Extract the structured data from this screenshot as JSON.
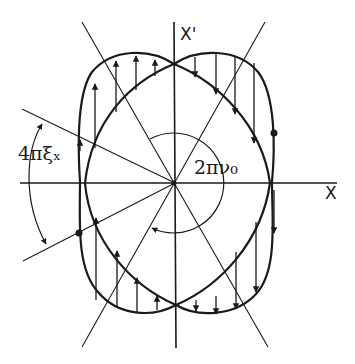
{
  "figure": {
    "width": 355,
    "height": 364,
    "ink_color": "#1a1a1a",
    "background": "#ffffff",
    "center": [
      175,
      183
    ]
  },
  "labels": {
    "x_axis": "X",
    "x_prime_axis": "X'",
    "tune_angle": "2πν₀",
    "chromatic_angle": "4πξₓ"
  },
  "axes": {
    "horizontal": {
      "x1": 20,
      "y1": 183,
      "x2": 337,
      "y2": 183
    },
    "vertical": {
      "x1": 174,
      "y1": 22,
      "x2": 176,
      "y2": 348
    }
  },
  "radial_lines": [
    {
      "name": "radial-line-upper-left",
      "x1": 82,
      "y1": 22,
      "x2": 268,
      "y2": 347
    },
    {
      "name": "radial-line-upper-right",
      "x1": 265,
      "y1": 22,
      "x2": 82,
      "y2": 347
    },
    {
      "name": "radial-line-shallow-left",
      "x1": 22,
      "y1": 109,
      "x2": 175,
      "y2": 183
    },
    {
      "name": "radial-line-shallow-lower",
      "x1": 175,
      "y1": 183,
      "x2": 23,
      "y2": 261
    }
  ],
  "curves": {
    "outer_left": "M 174 64 C 150 48, 112 48, 92 72 C 76 95, 78 150, 80 182 C 80 220, 76 268, 98 292 C 118 316, 152 318, 176 305",
    "outer_right": "M 174 64 C 198 48, 238 48, 258 72 C 276 95, 275 150, 272 182 C 272 220, 278 270, 256 294 C 236 316, 198 318, 176 305",
    "inner_left": "M 174 64 C 130 82, 92 120, 85 183 C 90 240, 130 285, 176 305",
    "inner_right": "M 174 64 C 218 82, 262 125, 270 183 C 262 240, 222 285, 176 305"
  },
  "arrows_up": [
    {
      "x": 80,
      "y1": 151,
      "y2": 140
    },
    {
      "x": 95,
      "y1": 148,
      "y2": 84
    },
    {
      "x": 116,
      "y1": 112,
      "y2": 61
    },
    {
      "x": 136,
      "y1": 90,
      "y2": 56
    },
    {
      "x": 155,
      "y1": 76,
      "y2": 60
    },
    {
      "x": 96,
      "y1": 300,
      "y2": 218
    },
    {
      "x": 117,
      "y1": 306,
      "y2": 251
    },
    {
      "x": 137,
      "y1": 313,
      "y2": 278
    },
    {
      "x": 157,
      "y1": 310,
      "y2": 296
    }
  ],
  "arrows_down": [
    {
      "x": 195,
      "y1": 57,
      "y2": 77
    },
    {
      "x": 216,
      "y1": 54,
      "y2": 94
    },
    {
      "x": 235,
      "y1": 57,
      "y2": 114
    },
    {
      "x": 254,
      "y1": 63,
      "y2": 143
    },
    {
      "x": 196,
      "y1": 300,
      "y2": 311
    },
    {
      "x": 216,
      "y1": 296,
      "y2": 314
    },
    {
      "x": 236,
      "y1": 252,
      "y2": 309
    },
    {
      "x": 256,
      "y1": 222,
      "y2": 292
    },
    {
      "x": 274,
      "y1": 190,
      "y2": 233
    }
  ],
  "dots": [
    {
      "x": 274,
      "y": 133
    },
    {
      "x": 79,
      "y": 233
    }
  ],
  "arcs": {
    "tune_arc": "M 150 139 A 50 50 0 1 1 152 228",
    "chromatic_arc": "M 42 124 C 26 150, 22 200, 46 244"
  }
}
